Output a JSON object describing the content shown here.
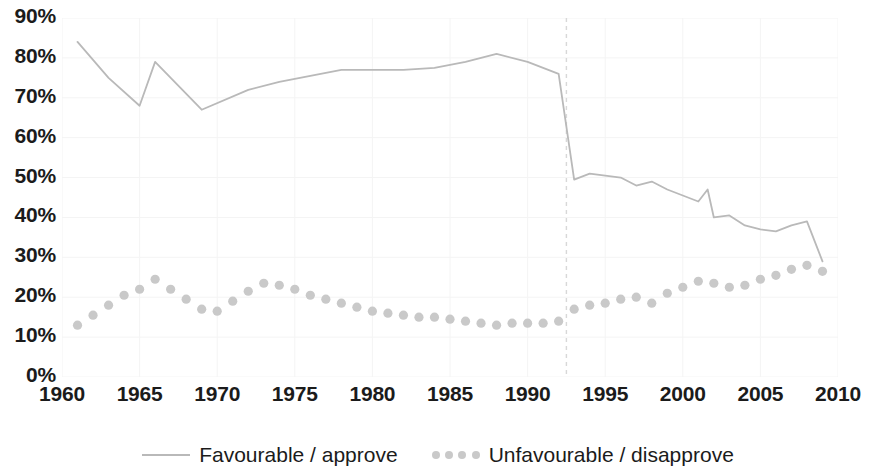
{
  "axes": {
    "y_ticks": [
      "0%",
      "10%",
      "20%",
      "30%",
      "40%",
      "50%",
      "60%",
      "70%",
      "80%",
      "90%"
    ],
    "x_ticks": [
      "1960",
      "1965",
      "1970",
      "1975",
      "1980",
      "1985",
      "1990",
      "1995",
      "2000",
      "2005",
      "2010"
    ]
  },
  "legend": {
    "favourable_label": "Favourable / approve",
    "unfavourable_label": "Unfavourable / disapprove"
  },
  "colors": {
    "favourable_line": "#b9b9b9",
    "unfavourable_dots": "#c9c9c9",
    "grid": "#f4f4f4",
    "reference_line": "#d8d8d8",
    "text": "#1b1b1b"
  },
  "chart_data": {
    "type": "line",
    "title": "",
    "subtitle": "",
    "xlabel": "",
    "ylabel": "",
    "xlim": [
      1960,
      2010
    ],
    "ylim": [
      0,
      90
    ],
    "grid": true,
    "legend_position": "bottom",
    "y_tick_values": [
      0,
      10,
      20,
      30,
      40,
      50,
      60,
      70,
      80,
      90
    ],
    "x_tick_values": [
      1960,
      1965,
      1970,
      1975,
      1980,
      1985,
      1990,
      1995,
      2000,
      2005,
      2010
    ],
    "annotations": [
      {
        "type": "vertical-dashed-line",
        "x": 1992.5,
        "label": ""
      }
    ],
    "series": [
      {
        "name": "Favourable / approve",
        "style": "solid-line",
        "color": "#b9b9b9",
        "x": [
          1961,
          1963,
          1965,
          1966,
          1969,
          1972,
          1974,
          1976,
          1978,
          1980,
          1982,
          1984,
          1986,
          1988,
          1990,
          1992,
          1993,
          1994,
          1995,
          1996,
          1997,
          1998,
          1999,
          2000,
          2001,
          2001.6,
          2002,
          2003,
          2004,
          2005,
          2006,
          2007,
          2008,
          2009
        ],
        "values": [
          84,
          75,
          68,
          79,
          67,
          72,
          74,
          75.5,
          77,
          77,
          77,
          77.5,
          79,
          81,
          79,
          76,
          49.5,
          51,
          50.5,
          50,
          48,
          49,
          47,
          45.5,
          44,
          47,
          40,
          40.5,
          38,
          37,
          36.5,
          38,
          39,
          29
        ]
      },
      {
        "name": "Unfavourable / disapprove",
        "style": "dotted-markers",
        "color": "#c9c9c9",
        "x": [
          1961,
          1962,
          1963,
          1964,
          1965,
          1966,
          1967,
          1968,
          1969,
          1970,
          1971,
          1972,
          1973,
          1974,
          1975,
          1976,
          1977,
          1978,
          1979,
          1980,
          1981,
          1982,
          1983,
          1984,
          1985,
          1986,
          1987,
          1988,
          1989,
          1990,
          1991,
          1992,
          1993,
          1994,
          1995,
          1996,
          1997,
          1998,
          1999,
          2000,
          2001,
          2002,
          2003,
          2004,
          2005,
          2006,
          2007,
          2008,
          2009
        ],
        "values": [
          13,
          15.5,
          18,
          20.5,
          22,
          24.5,
          22,
          19.5,
          17,
          16.5,
          19,
          21.5,
          23.5,
          23,
          22,
          20.5,
          19.5,
          18.5,
          17.5,
          16.5,
          16,
          15.5,
          15,
          15,
          14.5,
          14,
          13.5,
          13,
          13.5,
          13.5,
          13.5,
          14,
          17,
          18,
          18.5,
          19.5,
          20,
          18.5,
          21,
          22.5,
          24,
          23.5,
          22.5,
          23,
          24.5,
          25.5,
          27,
          28,
          26.5
        ]
      }
    ]
  }
}
